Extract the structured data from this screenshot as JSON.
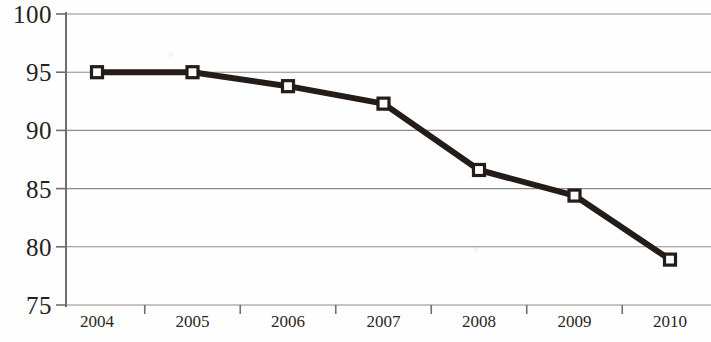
{
  "chart_data": {
    "type": "line",
    "title": "",
    "subtitle": "",
    "xlabel": "",
    "ylabel": "",
    "categories": [
      "2004",
      "2005",
      "2006",
      "2007",
      "2008",
      "2009",
      "2010"
    ],
    "values": [
      95.0,
      95.0,
      93.8,
      92.3,
      86.6,
      84.4,
      78.9
    ],
    "series": [
      {
        "name": "",
        "values": [
          95.0,
          95.0,
          93.8,
          92.3,
          86.6,
          84.4,
          78.9
        ]
      }
    ],
    "ylim": [
      75,
      100
    ],
    "y_ticks": [
      75,
      80,
      85,
      90,
      95,
      100
    ],
    "y_tick_labels": [
      "75",
      "80",
      "85",
      "90",
      "95",
      "100"
    ],
    "x_tick_labels": [
      "2004",
      "2005",
      "2006",
      "2007",
      "2008",
      "2009",
      "2010"
    ],
    "grid": true,
    "grid_axis": "y",
    "legend": false,
    "legend_position": "none",
    "marker": "square",
    "marker_fill": "#ffffff",
    "line_color": "#241c18",
    "grid_color": "#8d8c8a",
    "axis_color": "#6f6e6c",
    "background_color": "#fefefe",
    "annotations": []
  }
}
